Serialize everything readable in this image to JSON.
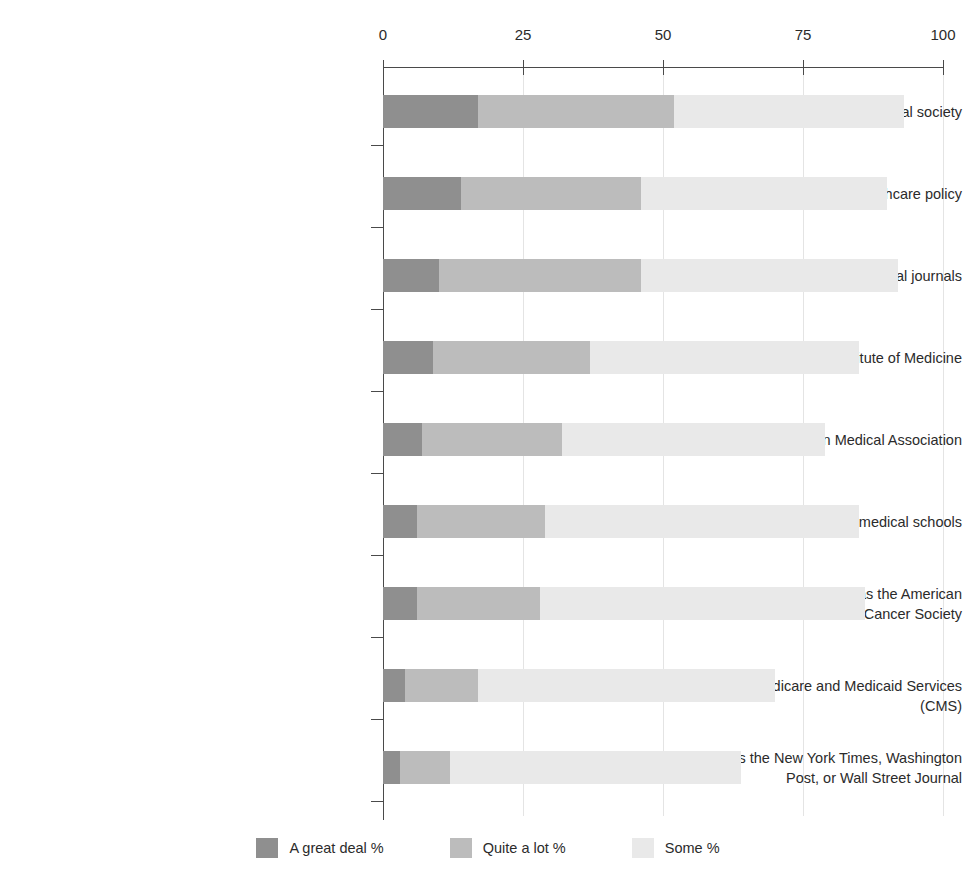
{
  "chart_data": {
    "type": "bar",
    "orientation": "horizontal",
    "stacked": true,
    "title": "",
    "subtitle": "",
    "xlabel": "",
    "ylabel": "",
    "xlim": [
      0,
      100
    ],
    "xticks": [
      0,
      25,
      50,
      75,
      100
    ],
    "xtick_labels": [
      "0",
      "25",
      "50",
      "75",
      "100"
    ],
    "grid": "vertical",
    "legend_position": "bottom",
    "categories": [
      "Leaders of your professional society",
      "University researchers who study healthcare policy",
      "Editors of leading medical journals",
      "The Institute of Medicine",
      "The American Medical Association",
      "Deans of leading medical schools",
      "Patient advocacy groups such as the American Heart Association or the American Cancer Society",
      "The Centers for Medicare and Medicaid Services (CMS)",
      "Newspapers such as the New York Times, Washington Post, or Wall Street Journal"
    ],
    "category_lines": [
      [
        "Leaders of your professional society"
      ],
      [
        "University researchers who study healthcare policy"
      ],
      [
        "Editors of leading medical journals"
      ],
      [
        "The Institute of Medicine"
      ],
      [
        "The American Medical Association"
      ],
      [
        "Deans of leading medical schools"
      ],
      [
        "Patient advocacy groups such as the American",
        "Heart Association or the American Cancer Society"
      ],
      [
        "The Centers for Medicare and Medicaid Services (CMS)"
      ],
      [
        "Newspapers such as the New York Times, Washington",
        "Post, or Wall Street Journal"
      ]
    ],
    "series": [
      {
        "name": "A great deal %",
        "color": "#8f8f8f",
        "values": [
          17,
          14,
          10,
          9,
          7,
          6,
          6,
          4,
          3
        ]
      },
      {
        "name": "Quite a lot %",
        "color": "#bcbcbc",
        "values": [
          35,
          32,
          36,
          28,
          25,
          23,
          22,
          13,
          9
        ]
      },
      {
        "name": "Some %",
        "color": "#e9e9e9",
        "values": [
          41,
          44,
          46,
          48,
          47,
          56,
          58,
          53,
          52
        ]
      }
    ],
    "totals": [
      93,
      90,
      92,
      85,
      79,
      85,
      86,
      70,
      64
    ]
  },
  "legend": {
    "items": [
      {
        "label": "A great deal %",
        "color": "#8f8f8f"
      },
      {
        "label": "Quite a lot %",
        "color": "#bcbcbc"
      },
      {
        "label": "Some %",
        "color": "#e9e9e9"
      }
    ]
  },
  "axis": {
    "tick_labels": [
      "0",
      "25",
      "50",
      "75",
      "100"
    ]
  }
}
